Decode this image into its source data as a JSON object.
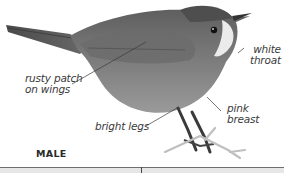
{
  "figure": {
    "caption": "MALE",
    "labels": {
      "rusty_patch_line1": "rusty patch",
      "rusty_patch_line2": "on wings",
      "white_throat_line1": "white",
      "white_throat_line2": "throat",
      "pink_breast_line1": "pink",
      "pink_breast_line2": "breast",
      "bright_legs": "bright legs"
    }
  },
  "colors": {
    "plumage_dark": "#5a5a5a",
    "plumage_mid": "#8a8a8a",
    "throat": "#e8e8e8",
    "leader_line": "#3a3a3a",
    "bottom_band": "#e6e6e6"
  }
}
